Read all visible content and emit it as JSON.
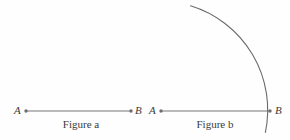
{
  "diagram": {
    "background_color": "#fefefe",
    "stroke_color": "#777777",
    "text_color": "#3b3b3b",
    "figures": [
      {
        "id": "figure-a",
        "caption": "Figure a",
        "endpoints": [
          {
            "name": "A",
            "label": "A",
            "x": 26,
            "y": 111
          },
          {
            "name": "B",
            "label": "B",
            "x": 131,
            "y": 111
          }
        ],
        "segment": {
          "x1": 26,
          "y1": 111,
          "x2": 131,
          "y2": 111
        },
        "has_arc": false
      },
      {
        "id": "figure-b",
        "caption": "Figure b",
        "endpoints": [
          {
            "name": "A",
            "label": "A",
            "x": 161,
            "y": 111
          },
          {
            "name": "B",
            "label": "B",
            "x": 270,
            "y": 111
          }
        ],
        "segment": {
          "x1": 161,
          "y1": 111,
          "x2": 270,
          "y2": 111
        },
        "has_arc": true,
        "arc": {
          "center_x": 161,
          "center_y": 111,
          "radius": 109,
          "start_x": 190,
          "start_y": 11,
          "end_x": 269,
          "end_y": 132,
          "path": "M 190.5 5.8 A 109 109 0 0 1 265.4 132.4"
        }
      }
    ]
  },
  "labels": {
    "figure_a_point_a": "A",
    "figure_a_point_b": "B",
    "figure_b_point_a": "A",
    "figure_b_point_b": "B",
    "caption_a": "Figure a",
    "caption_b": "Figure b"
  }
}
